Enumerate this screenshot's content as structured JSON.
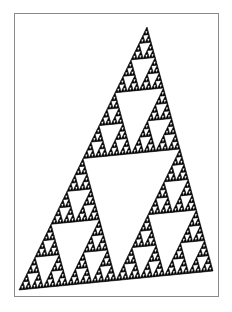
{
  "figure": {
    "fill_color": "#000000",
    "background_color": "#ffffff",
    "border_color": "#8a8a8a",
    "vertices": {
      "apex": [
        147,
        27
      ],
      "bottom_left": [
        19,
        290
      ],
      "bottom_right": [
        213,
        271
      ]
    },
    "recursion_depth": 6
  }
}
